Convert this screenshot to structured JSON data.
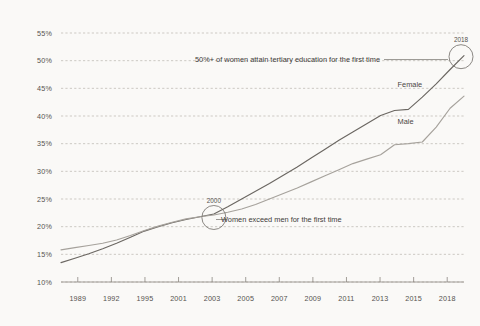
{
  "chart_data": {
    "type": "line",
    "title": "",
    "subtitle": "",
    "xlabel": "",
    "ylabel": "",
    "grid": true,
    "legend_position": "inline-right",
    "background_color": "#faf9f7",
    "xlim": [
      1989,
      2018
    ],
    "ylim": [
      10,
      55
    ],
    "y_ticks": [
      "10%",
      "15%",
      "20%",
      "25%",
      "30%",
      "35%",
      "40%",
      "45%",
      "50%",
      "55%"
    ],
    "y_tick_values": [
      10,
      15,
      20,
      25,
      30,
      35,
      40,
      45,
      50,
      55
    ],
    "x_ticks": [
      "1989",
      "1992",
      "1995",
      "2001",
      "2003",
      "2005",
      "2007",
      "2009",
      "2011",
      "2013",
      "2015",
      "2018"
    ],
    "x": [
      1989,
      1990,
      1991,
      1992,
      1993,
      1994,
      1995,
      1996,
      1997,
      1998,
      1999,
      2000,
      2001,
      2002,
      2003,
      2004,
      2005,
      2006,
      2007,
      2008,
      2009,
      2010,
      2011,
      2012,
      2013,
      2014,
      2015,
      2016,
      2017,
      2018
    ],
    "series": [
      {
        "name": "Female",
        "color": "#6b6762",
        "values": [
          13.5,
          14.3,
          15.1,
          16.0,
          17.0,
          18.1,
          19.2,
          20.0,
          20.7,
          21.3,
          21.8,
          22.3,
          23.6,
          25.0,
          26.4,
          27.8,
          29.3,
          30.8,
          32.4,
          34.0,
          35.6,
          37.1,
          38.6,
          40.1,
          41.0,
          41.2,
          43.4,
          45.8,
          48.4,
          50.9
        ]
      },
      {
        "name": "Male",
        "color": "#a6a29c",
        "values": [
          15.8,
          16.2,
          16.6,
          17.0,
          17.6,
          18.4,
          19.3,
          20.1,
          20.8,
          21.4,
          21.8,
          22.1,
          22.6,
          23.2,
          24.0,
          25.0,
          26.0,
          27.0,
          28.1,
          29.2,
          30.3,
          31.4,
          32.2,
          33.0,
          34.8,
          35.0,
          35.3,
          38.0,
          41.4,
          43.6
        ]
      }
    ],
    "annotations": [
      {
        "id": "women-tertiary-milestone",
        "text": "50%+ of women attain tertiary education for the first time",
        "target_x": 2018,
        "target_y": 50.9
      },
      {
        "id": "crossover-milestone",
        "text": "Women exceed men for the first time",
        "target_x": 2000,
        "target_y": 22.2
      }
    ],
    "point_labels": [
      {
        "id": "year-2018",
        "text": "2018",
        "x": 2018,
        "y": 50.9
      },
      {
        "id": "year-2000",
        "text": "2000",
        "x": 2000,
        "y": 22.2
      }
    ],
    "series_labels": [
      {
        "id": "female",
        "text": "Female"
      },
      {
        "id": "male",
        "text": "Male"
      }
    ]
  }
}
